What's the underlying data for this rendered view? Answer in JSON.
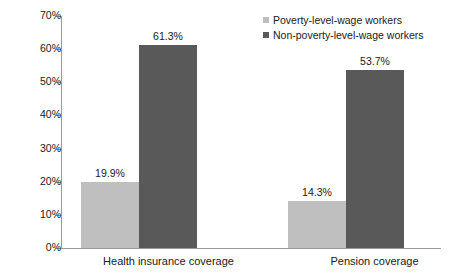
{
  "chart_data": {
    "type": "bar",
    "title": "",
    "xlabel": "",
    "ylabel": "",
    "categories": [
      "Health insurance coverage",
      "Pension coverage"
    ],
    "series": [
      {
        "name": "Poverty-level-wage workers",
        "color": "#bfbfbf",
        "values": [
          19.9,
          14.3
        ],
        "labels": [
          "19.9%",
          "14.3%"
        ]
      },
      {
        "name": "Non-poverty-level-wage workers",
        "color": "#595959",
        "values": [
          61.3,
          53.7
        ],
        "labels": [
          "61.3%",
          "53.7%"
        ]
      }
    ],
    "ylim": [
      0,
      70
    ],
    "ytick_values": [
      0,
      10,
      20,
      30,
      40,
      50,
      60,
      70
    ],
    "ytick_labels": [
      "0%",
      "10%",
      "20%",
      "30%",
      "40%",
      "50%",
      "60%",
      "70%"
    ],
    "grid": false,
    "legend_position": "top-right",
    "axis_color": "#9a9a9a",
    "text_color": "#202020",
    "background": "#ffffff"
  }
}
